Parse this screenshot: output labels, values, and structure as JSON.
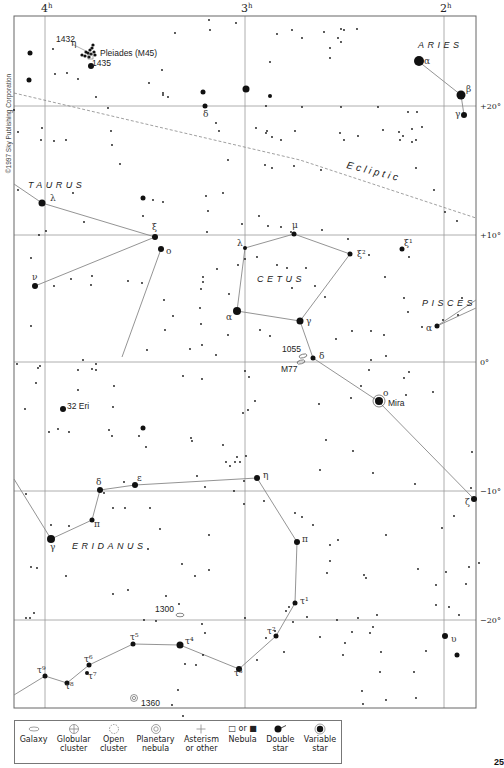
{
  "copyright": "©1997 Sky Publishing Corporation",
  "page_number": "25",
  "frame": {
    "x1": 14,
    "y1": 16,
    "x2": 476,
    "y2": 708
  },
  "ra_lines": [
    {
      "label": "4",
      "sup": "h",
      "x": 45
    },
    {
      "label": "3",
      "sup": "h",
      "x": 245
    },
    {
      "label": "2",
      "sup": "h",
      "x": 444
    }
  ],
  "dec_lines": [
    {
      "label": "+20°",
      "y": 106
    },
    {
      "label": "+10°",
      "y": 235
    },
    {
      "label": "0°",
      "y": 362
    },
    {
      "label": "−10°",
      "y": 491
    },
    {
      "label": "−20°",
      "y": 620
    }
  ],
  "constellations": [
    {
      "name": "ARIES",
      "x": 418,
      "y": 48
    },
    {
      "name": "TAURUS",
      "x": 28,
      "y": 188
    },
    {
      "name": "CETUS",
      "x": 257,
      "y": 282
    },
    {
      "name": "PISCES",
      "x": 422,
      "y": 306
    },
    {
      "name": "ERIDANUS",
      "x": 72,
      "y": 549
    }
  ],
  "ecliptic": {
    "label": "Ecliptic",
    "x": 346,
    "y": 168,
    "angle": 14,
    "path": [
      [
        14,
        93
      ],
      [
        150,
        125
      ],
      [
        300,
        160
      ],
      [
        476,
        218
      ]
    ]
  },
  "objects": [
    {
      "label": "Pleiades (M45)",
      "x": 100,
      "y": 56
    },
    {
      "label": "1432",
      "x": 56,
      "y": 42
    },
    {
      "label": "1435",
      "x": 92,
      "y": 66
    },
    {
      "label": "32 Eri",
      "x": 67,
      "y": 409
    },
    {
      "label": "Mira",
      "x": 388,
      "y": 406
    },
    {
      "label": "1055",
      "x": 282,
      "y": 352
    },
    {
      "label": "M77",
      "x": 281,
      "y": 372
    },
    {
      "label": "1300",
      "x": 155,
      "y": 612
    },
    {
      "label": "1360",
      "x": 141,
      "y": 706
    }
  ],
  "star_labels": [
    {
      "t": "η",
      "x": 71,
      "y": 46
    },
    {
      "t": "α",
      "x": 424,
      "y": 64
    },
    {
      "t": "β",
      "x": 466,
      "y": 92
    },
    {
      "t": "γ",
      "x": 455,
      "y": 117
    },
    {
      "t": "δ",
      "x": 203,
      "y": 117
    },
    {
      "t": "λ",
      "x": 50,
      "y": 201
    },
    {
      "t": "ξ",
      "x": 152,
      "y": 230
    },
    {
      "t": "o",
      "x": 166,
      "y": 254
    },
    {
      "t": "ν",
      "x": 32,
      "y": 280
    },
    {
      "t": "λ",
      "x": 237,
      "y": 246
    },
    {
      "t": "μ",
      "x": 292,
      "y": 228
    },
    {
      "t": "ξ²",
      "x": 357,
      "y": 257
    },
    {
      "t": "ξ¹",
      "x": 404,
      "y": 246
    },
    {
      "t": "α",
      "x": 226,
      "y": 320
    },
    {
      "t": "γ",
      "x": 306,
      "y": 324
    },
    {
      "t": "δ",
      "x": 319,
      "y": 359
    },
    {
      "t": "α",
      "x": 426,
      "y": 331
    },
    {
      "t": "o",
      "x": 383,
      "y": 396
    },
    {
      "t": "ζ",
      "x": 465,
      "y": 505
    },
    {
      "t": "η",
      "x": 263,
      "y": 478
    },
    {
      "t": "δ",
      "x": 96,
      "y": 485
    },
    {
      "t": "ε",
      "x": 137,
      "y": 481
    },
    {
      "t": "π",
      "x": 94,
      "y": 527
    },
    {
      "t": "γ",
      "x": 50,
      "y": 550
    },
    {
      "t": "π",
      "x": 302,
      "y": 542
    },
    {
      "t": "τ¹",
      "x": 300,
      "y": 604
    },
    {
      "t": "τ²",
      "x": 267,
      "y": 634
    },
    {
      "t": "υ",
      "x": 451,
      "y": 642
    },
    {
      "t": "τ³",
      "x": 234,
      "y": 676
    },
    {
      "t": "τ⁴",
      "x": 185,
      "y": 644
    },
    {
      "t": "τ⁵",
      "x": 130,
      "y": 640
    },
    {
      "t": "τ⁶",
      "x": 84,
      "y": 662
    },
    {
      "t": "τ⁷",
      "x": 88,
      "y": 679
    },
    {
      "t": "τ⁸",
      "x": 65,
      "y": 689
    },
    {
      "t": "τ⁹",
      "x": 37,
      "y": 673
    }
  ],
  "figure_lines": [
    [
      [
        418,
        61
      ],
      [
        461,
        95
      ],
      [
        464,
        115
      ]
    ],
    [
      [
        14,
        184
      ],
      [
        42,
        203
      ],
      [
        155,
        237
      ],
      [
        35,
        286
      ]
    ],
    [
      [
        161,
        249
      ],
      [
        122,
        357
      ]
    ],
    [
      [
        245,
        248
      ],
      [
        294,
        234
      ],
      [
        350,
        254
      ],
      [
        300,
        321
      ],
      [
        237,
        311
      ],
      [
        245,
        248
      ]
    ],
    [
      [
        300,
        321
      ],
      [
        313,
        358
      ],
      [
        378,
        401
      ],
      [
        474,
        499
      ]
    ],
    [
      [
        437,
        326
      ],
      [
        476,
        300
      ]
    ],
    [
      [
        437,
        326
      ],
      [
        476,
        308
      ]
    ],
    [
      [
        14,
        479
      ],
      [
        51,
        539
      ],
      [
        92,
        520
      ],
      [
        100,
        490
      ],
      [
        135,
        485
      ],
      [
        257,
        478
      ],
      [
        297,
        542
      ],
      [
        295,
        603
      ],
      [
        276,
        636
      ],
      [
        239,
        669
      ],
      [
        180,
        645
      ],
      [
        133,
        644
      ],
      [
        89,
        665
      ],
      [
        67,
        683
      ],
      [
        45,
        676
      ],
      [
        14,
        695
      ]
    ]
  ],
  "bright_stars": [
    [
      419,
      61,
      5
    ],
    [
      461,
      95,
      4.5
    ],
    [
      464,
      115,
      3
    ],
    [
      42,
      203,
      3.5
    ],
    [
      155,
      237,
      3
    ],
    [
      161,
      249,
      3
    ],
    [
      35,
      286,
      3
    ],
    [
      245,
      248,
      2
    ],
    [
      294,
      234,
      2.5
    ],
    [
      350,
      254,
      2.5
    ],
    [
      237,
      311,
      4
    ],
    [
      300,
      321,
      3.5
    ],
    [
      313,
      358,
      2.5
    ],
    [
      437,
      326,
      2.5
    ],
    [
      379,
      401,
      4
    ],
    [
      474,
      499,
      3
    ],
    [
      257,
      478,
      3
    ],
    [
      100,
      490,
      3
    ],
    [
      135,
      485,
      3
    ],
    [
      92,
      520,
      2.5
    ],
    [
      51,
      539,
      4
    ],
    [
      297,
      542,
      3
    ],
    [
      295,
      603,
      2.5
    ],
    [
      276,
      636,
      2.5
    ],
    [
      239,
      669,
      3
    ],
    [
      180,
      645,
      3.5
    ],
    [
      133,
      644,
      2.5
    ],
    [
      89,
      665,
      2.5
    ],
    [
      67,
      683,
      2.5
    ],
    [
      45,
      676,
      2.5
    ],
    [
      87,
      673,
      2
    ],
    [
      445,
      636,
      3
    ],
    [
      457,
      655,
      2.5
    ],
    [
      205,
      106,
      2.5
    ],
    [
      91,
      66,
      3
    ],
    [
      402,
      249,
      2.5
    ],
    [
      143,
      198,
      2.5
    ],
    [
      63,
      409,
      3
    ],
    [
      143,
      428,
      2.5
    ],
    [
      30,
      53,
      2.5
    ],
    [
      203,
      92,
      2.5
    ],
    [
      246,
      89,
      3.5
    ],
    [
      29,
      80,
      2.5
    ],
    [
      270,
      96,
      2
    ]
  ],
  "faint_stars": [
    [
      14,
      110
    ],
    [
      42,
      128
    ],
    [
      41,
      140
    ],
    [
      67,
      73
    ],
    [
      53,
      49
    ],
    [
      55,
      74
    ],
    [
      78,
      79
    ],
    [
      96,
      97
    ],
    [
      108,
      108
    ],
    [
      162,
      70
    ],
    [
      149,
      83
    ],
    [
      163,
      93
    ],
    [
      175,
      33
    ],
    [
      209,
      20
    ],
    [
      236,
      23
    ],
    [
      163,
      95
    ],
    [
      168,
      97
    ],
    [
      210,
      30
    ],
    [
      277,
      34
    ],
    [
      292,
      30
    ],
    [
      302,
      38
    ],
    [
      324,
      32
    ],
    [
      341,
      29
    ],
    [
      330,
      48
    ],
    [
      330,
      58
    ],
    [
      341,
      42
    ],
    [
      270,
      62
    ],
    [
      338,
      38
    ],
    [
      344,
      30
    ],
    [
      357,
      29
    ],
    [
      266,
      106
    ],
    [
      341,
      107
    ],
    [
      302,
      107
    ],
    [
      378,
      107
    ],
    [
      408,
      112
    ],
    [
      417,
      112
    ],
    [
      383,
      130
    ],
    [
      399,
      132
    ],
    [
      416,
      140
    ],
    [
      403,
      136
    ],
    [
      412,
      129
    ],
    [
      422,
      127
    ],
    [
      18,
      132
    ],
    [
      54,
      141
    ],
    [
      66,
      140
    ],
    [
      111,
      131
    ],
    [
      112,
      145
    ],
    [
      120,
      164
    ],
    [
      216,
      123
    ],
    [
      219,
      131
    ],
    [
      228,
      160
    ],
    [
      266,
      133
    ],
    [
      272,
      137
    ],
    [
      256,
      128
    ],
    [
      267,
      131
    ],
    [
      281,
      140
    ],
    [
      295,
      131
    ],
    [
      340,
      133
    ],
    [
      344,
      140
    ],
    [
      358,
      136
    ],
    [
      400,
      140
    ],
    [
      412,
      142
    ],
    [
      18,
      190
    ],
    [
      73,
      193
    ],
    [
      84,
      222
    ],
    [
      39,
      235
    ],
    [
      46,
      231
    ],
    [
      143,
      216
    ],
    [
      153,
      200
    ],
    [
      163,
      202
    ],
    [
      206,
      196
    ],
    [
      223,
      193
    ],
    [
      208,
      211
    ],
    [
      242,
      224
    ],
    [
      265,
      165
    ],
    [
      272,
      168
    ],
    [
      294,
      166
    ],
    [
      321,
      170
    ],
    [
      416,
      168
    ],
    [
      434,
      190
    ],
    [
      445,
      212
    ],
    [
      457,
      221
    ],
    [
      31,
      258
    ],
    [
      71,
      279
    ],
    [
      54,
      286
    ],
    [
      92,
      276
    ],
    [
      91,
      285
    ],
    [
      128,
      281
    ],
    [
      142,
      283
    ],
    [
      203,
      277
    ],
    [
      164,
      300
    ],
    [
      173,
      316
    ],
    [
      165,
      330
    ],
    [
      147,
      350
    ],
    [
      31,
      326
    ],
    [
      229,
      294
    ],
    [
      228,
      335
    ],
    [
      216,
      355
    ],
    [
      38,
      368
    ],
    [
      83,
      360
    ],
    [
      78,
      370
    ],
    [
      96,
      370
    ],
    [
      92,
      369
    ],
    [
      207,
      232
    ],
    [
      259,
      216
    ],
    [
      268,
      226
    ],
    [
      281,
      227
    ],
    [
      291,
      232
    ],
    [
      257,
      257
    ],
    [
      245,
      259
    ],
    [
      217,
      269
    ],
    [
      238,
      265
    ],
    [
      277,
      265
    ],
    [
      287,
      268
    ],
    [
      322,
      230
    ],
    [
      348,
      239
    ],
    [
      369,
      255
    ],
    [
      385,
      277
    ],
    [
      409,
      257
    ],
    [
      404,
      298
    ],
    [
      422,
      327
    ],
    [
      443,
      320
    ],
    [
      408,
      312
    ],
    [
      458,
      315
    ],
    [
      462,
      298
    ],
    [
      203,
      282
    ],
    [
      201,
      289
    ],
    [
      200,
      308
    ],
    [
      201,
      324
    ],
    [
      202,
      345
    ],
    [
      190,
      349
    ],
    [
      260,
      330
    ],
    [
      270,
      336
    ],
    [
      292,
      288
    ],
    [
      306,
      268
    ],
    [
      315,
      286
    ],
    [
      325,
      297
    ],
    [
      336,
      339
    ],
    [
      352,
      331
    ],
    [
      371,
      331
    ],
    [
      384,
      335
    ],
    [
      369,
      370
    ],
    [
      386,
      356
    ],
    [
      371,
      360
    ],
    [
      404,
      378
    ],
    [
      409,
      372
    ],
    [
      17,
      364
    ],
    [
      40,
      366
    ],
    [
      96,
      364
    ],
    [
      114,
      386
    ],
    [
      183,
      376
    ],
    [
      202,
      379
    ],
    [
      245,
      371
    ],
    [
      249,
      377
    ],
    [
      255,
      401
    ],
    [
      248,
      410
    ],
    [
      243,
      413
    ],
    [
      36,
      383
    ],
    [
      78,
      390
    ],
    [
      113,
      407
    ],
    [
      49,
      432
    ],
    [
      69,
      432
    ],
    [
      109,
      430
    ],
    [
      112,
      436
    ],
    [
      139,
      436
    ],
    [
      146,
      447
    ],
    [
      191,
      438
    ],
    [
      192,
      441
    ],
    [
      223,
      445
    ],
    [
      230,
      466
    ],
    [
      235,
      462
    ],
    [
      240,
      462
    ],
    [
      246,
      456
    ],
    [
      226,
      462
    ],
    [
      351,
      398
    ],
    [
      361,
      386
    ],
    [
      319,
      404
    ],
    [
      326,
      440
    ],
    [
      353,
      451
    ],
    [
      320,
      470
    ],
    [
      373,
      473
    ],
    [
      406,
      395
    ],
    [
      433,
      392
    ],
    [
      415,
      484
    ],
    [
      442,
      528
    ],
    [
      471,
      488
    ],
    [
      472,
      452
    ],
    [
      454,
      516
    ],
    [
      25,
      409
    ],
    [
      58,
      429
    ],
    [
      26,
      494
    ],
    [
      51,
      525
    ],
    [
      69,
      526
    ],
    [
      104,
      493
    ],
    [
      113,
      508
    ],
    [
      124,
      482
    ],
    [
      125,
      508
    ],
    [
      150,
      508
    ],
    [
      160,
      529
    ],
    [
      148,
      549
    ],
    [
      197,
      476
    ],
    [
      205,
      487
    ],
    [
      209,
      535
    ],
    [
      237,
      457
    ],
    [
      244,
      481
    ],
    [
      264,
      501
    ],
    [
      234,
      491
    ],
    [
      295,
      513
    ],
    [
      302,
      517
    ],
    [
      209,
      570
    ],
    [
      244,
      504
    ],
    [
      313,
      525
    ],
    [
      330,
      545
    ],
    [
      338,
      540
    ],
    [
      386,
      535
    ],
    [
      330,
      561
    ],
    [
      327,
      573
    ],
    [
      364,
      575
    ],
    [
      366,
      578
    ],
    [
      418,
      569
    ],
    [
      436,
      585
    ],
    [
      469,
      567
    ],
    [
      466,
      584
    ],
    [
      459,
      615
    ],
    [
      31,
      567
    ],
    [
      37,
      568
    ],
    [
      66,
      576
    ],
    [
      113,
      594
    ],
    [
      128,
      590
    ],
    [
      166,
      596
    ],
    [
      182,
      564
    ],
    [
      195,
      576
    ],
    [
      179,
      604
    ],
    [
      144,
      620
    ],
    [
      156,
      621
    ],
    [
      245,
      618
    ],
    [
      286,
      611
    ],
    [
      289,
      607
    ],
    [
      293,
      622
    ],
    [
      275,
      631
    ],
    [
      266,
      638
    ],
    [
      202,
      624
    ],
    [
      205,
      633
    ],
    [
      203,
      655
    ],
    [
      185,
      664
    ],
    [
      196,
      665
    ],
    [
      178,
      690
    ],
    [
      172,
      705
    ],
    [
      183,
      716
    ],
    [
      257,
      660
    ],
    [
      284,
      652
    ],
    [
      307,
      617
    ],
    [
      320,
      637
    ],
    [
      337,
      620
    ],
    [
      352,
      632
    ],
    [
      358,
      618
    ],
    [
      373,
      627
    ],
    [
      377,
      615
    ],
    [
      345,
      643
    ],
    [
      343,
      655
    ],
    [
      370,
      633
    ],
    [
      381,
      652
    ],
    [
      436,
      605
    ],
    [
      446,
      572
    ],
    [
      449,
      607
    ],
    [
      479,
      563
    ],
    [
      426,
      651
    ],
    [
      380,
      672
    ],
    [
      362,
      691
    ],
    [
      414,
      672
    ],
    [
      416,
      698
    ],
    [
      363,
      704
    ],
    [
      386,
      700
    ],
    [
      26,
      618
    ],
    [
      34,
      613
    ],
    [
      30,
      618
    ]
  ],
  "pleiades_cluster": [
    [
      86,
      52
    ],
    [
      88,
      53
    ],
    [
      90,
      50
    ],
    [
      92,
      48
    ],
    [
      94,
      52
    ],
    [
      91,
      54
    ],
    [
      85,
      56
    ],
    [
      89,
      57
    ],
    [
      95,
      55
    ],
    [
      93,
      45
    ],
    [
      82,
      55
    ]
  ],
  "legend": [
    {
      "id": "galaxy",
      "label": "Galaxy"
    },
    {
      "id": "globular",
      "label": "Globular cluster"
    },
    {
      "id": "open",
      "label": "Open cluster"
    },
    {
      "id": "planetary",
      "label": "Planetary nebula"
    },
    {
      "id": "asterism",
      "label": "Asterism or other"
    },
    {
      "id": "nebula",
      "label": "Nebula",
      "prefix": "□ or ■"
    },
    {
      "id": "double",
      "label": "Double star"
    },
    {
      "id": "variable",
      "label": "Variable star"
    }
  ],
  "legend_labels": {
    "galaxy": [
      "Galaxy",
      ""
    ],
    "globular": [
      "Globular",
      "cluster"
    ],
    "open": [
      "Open",
      "cluster"
    ],
    "planetary": [
      "Planetary",
      "nebula"
    ],
    "asterism": [
      "Asterism",
      "or other"
    ],
    "nebula": [
      "Nebula",
      ""
    ],
    "double": [
      "Double",
      "star"
    ],
    "variable": [
      "Variable",
      "star"
    ]
  },
  "nebula_symbol_text": "□ or ■"
}
